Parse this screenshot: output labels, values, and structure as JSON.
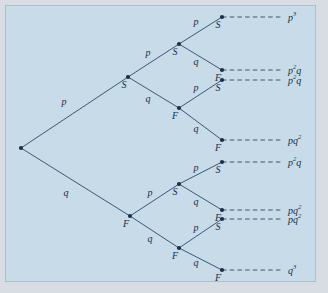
{
  "figure": {
    "type": "probability-tree-diagram",
    "background_color": "#c7dbe8",
    "line_color": "#2d4a66",
    "node_color": "#1b2f47",
    "text_color": "#17304a",
    "levels": 3,
    "root": {
      "x": 21,
      "y": 148
    }
  },
  "nodes": [
    {
      "id": "root",
      "label": "",
      "x": 21,
      "y": 148
    },
    {
      "id": "S1",
      "label": "S",
      "x": 128,
      "y": 77
    },
    {
      "id": "F1",
      "label": "F",
      "x": 130,
      "y": 216
    },
    {
      "id": "S2",
      "label": "S",
      "x": 179,
      "y": 44
    },
    {
      "id": "F2",
      "label": "F",
      "x": 179,
      "y": 108
    },
    {
      "id": "S3",
      "label": "S",
      "x": 179,
      "y": 184
    },
    {
      "id": "F3",
      "label": "F",
      "x": 179,
      "y": 248
    },
    {
      "id": "T1",
      "label": "S",
      "x": 222,
      "y": 17
    },
    {
      "id": "T2",
      "label": "F",
      "x": 222,
      "y": 70
    },
    {
      "id": "T3",
      "label": "S",
      "x": 222,
      "y": 80
    },
    {
      "id": "T4",
      "label": "F",
      "x": 222,
      "y": 140
    },
    {
      "id": "T5",
      "label": "S",
      "x": 222,
      "y": 162
    },
    {
      "id": "T6",
      "label": "F",
      "x": 222,
      "y": 210
    },
    {
      "id": "T7",
      "label": "S",
      "x": 222,
      "y": 219
    },
    {
      "id": "T8",
      "label": "F",
      "x": 222,
      "y": 270
    }
  ],
  "edges": [
    {
      "from": "root",
      "to": "S1",
      "label": "p",
      "lx": 64,
      "ly": 102
    },
    {
      "from": "root",
      "to": "F1",
      "label": "q",
      "lx": 66,
      "ly": 193
    },
    {
      "from": "S1",
      "to": "S2",
      "label": "p",
      "lx": 148,
      "ly": 53
    },
    {
      "from": "S1",
      "to": "F2",
      "label": "q",
      "lx": 148,
      "ly": 99
    },
    {
      "from": "F1",
      "to": "S3",
      "label": "p",
      "lx": 150,
      "ly": 193
    },
    {
      "from": "F1",
      "to": "F3",
      "label": "q",
      "lx": 150,
      "ly": 239
    },
    {
      "from": "S2",
      "to": "T1",
      "label": "p",
      "lx": 196,
      "ly": 22
    },
    {
      "from": "S2",
      "to": "T2",
      "label": "q",
      "lx": 196,
      "ly": 62
    },
    {
      "from": "F2",
      "to": "T3",
      "label": "p",
      "lx": 196,
      "ly": 88
    },
    {
      "from": "F2",
      "to": "T4",
      "label": "q",
      "lx": 196,
      "ly": 129
    },
    {
      "from": "S3",
      "to": "T5",
      "label": "p",
      "lx": 196,
      "ly": 168
    },
    {
      "from": "S3",
      "to": "T6",
      "label": "q",
      "lx": 196,
      "ly": 202
    },
    {
      "from": "F3",
      "to": "T7",
      "label": "p",
      "lx": 196,
      "ly": 228
    },
    {
      "from": "F3",
      "to": "T8",
      "label": "q",
      "lx": 196,
      "ly": 263
    }
  ],
  "outcomes": [
    {
      "from": "T1",
      "base": "p",
      "exp": "3",
      "text": "p3",
      "y": 17,
      "x": 288
    },
    {
      "from": "T2",
      "base": "p",
      "exp": "2",
      "text": "p2q",
      "y": 70,
      "x": 288
    },
    {
      "from": "T3",
      "base": "p",
      "exp": "2",
      "text": "p2q",
      "y": 80,
      "x": 288
    },
    {
      "from": "T4",
      "base": "pq",
      "exp": "2",
      "text": "pq2",
      "y": 140,
      "x": 288
    },
    {
      "from": "T5",
      "base": "p",
      "exp": "2",
      "text": "p2q",
      "y": 162,
      "x": 288
    },
    {
      "from": "T6",
      "base": "pq",
      "exp": "2",
      "text": "pq2",
      "y": 210,
      "x": 288
    },
    {
      "from": "T7",
      "base": "pq",
      "exp": "2",
      "text": "pq2",
      "y": 219,
      "x": 288
    },
    {
      "from": "T8",
      "base": "q",
      "exp": "3",
      "text": "q3",
      "y": 270,
      "x": 288
    }
  ],
  "outcome_labels": [
    {
      "main": "p",
      "sup": "3",
      "tail": ""
    },
    {
      "main": "p",
      "sup": "2",
      "tail": "q"
    },
    {
      "main": "p",
      "sup": "2",
      "tail": "q"
    },
    {
      "main": "pq",
      "sup": "2",
      "tail": ""
    },
    {
      "main": "p",
      "sup": "2",
      "tail": "q"
    },
    {
      "main": "pq",
      "sup": "2",
      "tail": ""
    },
    {
      "main": "pq",
      "sup": "2",
      "tail": ""
    },
    {
      "main": "q",
      "sup": "3",
      "tail": ""
    }
  ]
}
